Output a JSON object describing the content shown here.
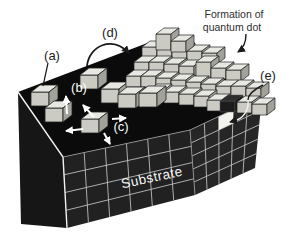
{
  "figure": {
    "type": "scientific-diagram",
    "callouts": {
      "a": "(a)",
      "b": "(b)",
      "c": "(c)",
      "d": "(d)",
      "e": "(e)"
    },
    "annotation": {
      "line1": "Formation of",
      "line2": "quantum dot"
    },
    "substrate": {
      "label": "Substrate"
    },
    "icons": [
      "adsorption-arrow-up",
      "surface-diffusion-arrows",
      "migration-arc-arrow",
      "formation-pointer-arrow",
      "buried-dot-pointer-arrow",
      "leader-line"
    ],
    "colors": {
      "background": "#ffffff",
      "substrate_top": "#0b0b0b",
      "substrate_left": "#161616",
      "substrate_front": "#212121",
      "substrate_right": "#262626",
      "grid_line": "#c6c6c6",
      "edge_highlight": "#f2f2f2",
      "cube_top": "#e8e8e3",
      "cube_front": "#cbcbc4",
      "cube_side": "#a2a29b",
      "cube_outline": "#1f1f1f",
      "dark_cube": "#1c1c1c",
      "buried_dot_cell": "#f3f3ef",
      "label_text": "#1b1b1b",
      "annotation_text": "#2e2e2e",
      "light_text": "#ffffff"
    }
  }
}
